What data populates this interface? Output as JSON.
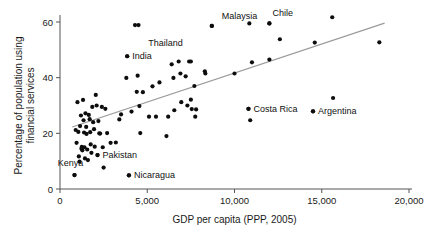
{
  "chart_data": {
    "type": "scatter",
    "title": "",
    "xlabel": "GDP per capita (PPP, 2005)",
    "ylabel": "Percentage of population using financial services",
    "ylabel_lines": [
      "Percentage of population using",
      "financial services"
    ],
    "xlim": [
      0,
      20000
    ],
    "ylim": [
      0,
      65
    ],
    "grid": false,
    "legend": false,
    "xticks": [
      0,
      5000,
      10000,
      15000,
      20000
    ],
    "xtick_labels": [
      "0",
      "5,000",
      "10,000",
      "15,000",
      "20,000"
    ],
    "yticks": [
      0,
      20,
      40,
      60
    ],
    "ytick_labels": [
      "0",
      "20",
      "40",
      "60"
    ],
    "dot_color": "#0d0d0d",
    "trend_color": "#9a9a9a",
    "axis_color": "#555555",
    "trendline": {
      "x": [
        700,
        18600
      ],
      "y": [
        22.3,
        59.6
      ]
    },
    "annotations": [
      {
        "label": "Malaysia",
        "x": 8700,
        "y": 58.6,
        "label_dx": 10,
        "label_dy": -7,
        "anchor": "start"
      },
      {
        "label": "Thailand",
        "x": 7500,
        "y": 45.8,
        "label_dx": -8,
        "label_dy": -16,
        "anchor": "end"
      },
      {
        "label": "Chile",
        "x": 12000,
        "y": 59.5,
        "label_dx": 3,
        "label_dy": -7,
        "anchor": "start"
      },
      {
        "label": "India",
        "x": 3850,
        "y": 47.7,
        "label_dx": 5,
        "label_dy": 3,
        "anchor": "start"
      },
      {
        "label": "Costa Rica",
        "x": 10800,
        "y": 28.8,
        "label_dx": 5,
        "label_dy": 3,
        "anchor": "start"
      },
      {
        "label": "Argentina",
        "x": 14500,
        "y": 27.9,
        "label_dx": 5,
        "label_dy": 3,
        "anchor": "start"
      },
      {
        "label": "Pakistan",
        "x": 2150,
        "y": 12.2,
        "label_dx": 5,
        "label_dy": 3,
        "anchor": "start"
      },
      {
        "label": "Nicaragua",
        "x": 3950,
        "y": 4.9,
        "label_dx": 5,
        "label_dy": 3,
        "anchor": "start"
      },
      {
        "label": "Kenya",
        "x": 830,
        "y": 5.0,
        "label_dx": -4,
        "label_dy": -9,
        "anchor": "middle"
      }
    ],
    "points": [
      {
        "x": 830,
        "y": 5.0
      },
      {
        "x": 900,
        "y": 21.2
      },
      {
        "x": 950,
        "y": 16.6
      },
      {
        "x": 1000,
        "y": 31.2
      },
      {
        "x": 1050,
        "y": 20.5
      },
      {
        "x": 1080,
        "y": 11.7
      },
      {
        "x": 1120,
        "y": 9.8
      },
      {
        "x": 1150,
        "y": 22.6
      },
      {
        "x": 1200,
        "y": 26.4
      },
      {
        "x": 1230,
        "y": 14.5
      },
      {
        "x": 1250,
        "y": 15.1
      },
      {
        "x": 1280,
        "y": 13.9
      },
      {
        "x": 1320,
        "y": 32.0
      },
      {
        "x": 1350,
        "y": 24.7
      },
      {
        "x": 1380,
        "y": 20.3
      },
      {
        "x": 1400,
        "y": 15.0
      },
      {
        "x": 1430,
        "y": 11.0
      },
      {
        "x": 1460,
        "y": 27.2
      },
      {
        "x": 1500,
        "y": 22.3
      },
      {
        "x": 1520,
        "y": 19.8
      },
      {
        "x": 1560,
        "y": 14.2
      },
      {
        "x": 1600,
        "y": 10.4
      },
      {
        "x": 1650,
        "y": 26.6
      },
      {
        "x": 1700,
        "y": 25.1
      },
      {
        "x": 1730,
        "y": 20.4
      },
      {
        "x": 1760,
        "y": 16.0
      },
      {
        "x": 1800,
        "y": 13.0
      },
      {
        "x": 1850,
        "y": 29.5
      },
      {
        "x": 1900,
        "y": 24.0
      },
      {
        "x": 1950,
        "y": 21.5
      },
      {
        "x": 1990,
        "y": 15.2
      },
      {
        "x": 2050,
        "y": 33.8
      },
      {
        "x": 2100,
        "y": 30.0
      },
      {
        "x": 2150,
        "y": 12.2
      },
      {
        "x": 2200,
        "y": 24.4
      },
      {
        "x": 2250,
        "y": 20.0
      },
      {
        "x": 2300,
        "y": 19.9
      },
      {
        "x": 2400,
        "y": 29.5
      },
      {
        "x": 2450,
        "y": 15.0
      },
      {
        "x": 2500,
        "y": 7.7
      },
      {
        "x": 2600,
        "y": 28.8
      },
      {
        "x": 2700,
        "y": 20.1
      },
      {
        "x": 2900,
        "y": 16.6
      },
      {
        "x": 3200,
        "y": 16.7
      },
      {
        "x": 3400,
        "y": 25.0
      },
      {
        "x": 3500,
        "y": 26.8
      },
      {
        "x": 3800,
        "y": 39.9
      },
      {
        "x": 3850,
        "y": 47.7
      },
      {
        "x": 3950,
        "y": 4.9
      },
      {
        "x": 4100,
        "y": 27.8
      },
      {
        "x": 4300,
        "y": 58.9
      },
      {
        "x": 4500,
        "y": 58.9
      },
      {
        "x": 4450,
        "y": 40.7
      },
      {
        "x": 4400,
        "y": 34.9
      },
      {
        "x": 4550,
        "y": 29.8
      },
      {
        "x": 4600,
        "y": 20.1
      },
      {
        "x": 4750,
        "y": 34.8
      },
      {
        "x": 5100,
        "y": 26.0
      },
      {
        "x": 5300,
        "y": 36.9
      },
      {
        "x": 5500,
        "y": 26.0
      },
      {
        "x": 5700,
        "y": 38.3
      },
      {
        "x": 6100,
        "y": 19.0
      },
      {
        "x": 6200,
        "y": 26.0
      },
      {
        "x": 6400,
        "y": 44.8
      },
      {
        "x": 6500,
        "y": 39.9
      },
      {
        "x": 6550,
        "y": 28.3
      },
      {
        "x": 6800,
        "y": 45.8
      },
      {
        "x": 6900,
        "y": 41.5
      },
      {
        "x": 6950,
        "y": 31.2
      },
      {
        "x": 7200,
        "y": 40.5
      },
      {
        "x": 7300,
        "y": 30.0
      },
      {
        "x": 7400,
        "y": 45.8
      },
      {
        "x": 7500,
        "y": 32.1
      },
      {
        "x": 7550,
        "y": 28.7
      },
      {
        "x": 7700,
        "y": 37.0
      },
      {
        "x": 7750,
        "y": 26.0
      },
      {
        "x": 7800,
        "y": 28.6
      },
      {
        "x": 8300,
        "y": 42.3
      },
      {
        "x": 8330,
        "y": 41.5
      },
      {
        "x": 8700,
        "y": 58.6
      },
      {
        "x": 10000,
        "y": 41.5
      },
      {
        "x": 10800,
        "y": 28.8
      },
      {
        "x": 10900,
        "y": 24.7
      },
      {
        "x": 10850,
        "y": 59.5
      },
      {
        "x": 11000,
        "y": 45.5
      },
      {
        "x": 12000,
        "y": 59.5
      },
      {
        "x": 12000,
        "y": 46.5
      },
      {
        "x": 12600,
        "y": 53.8
      },
      {
        "x": 14500,
        "y": 27.9
      },
      {
        "x": 14600,
        "y": 52.6
      },
      {
        "x": 15600,
        "y": 61.7
      },
      {
        "x": 15650,
        "y": 32.7
      },
      {
        "x": 18300,
        "y": 52.7
      }
    ]
  }
}
